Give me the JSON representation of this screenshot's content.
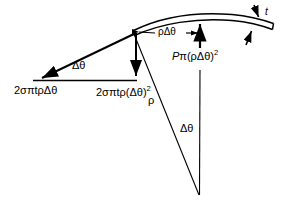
{
  "figure": {
    "stroke_color": "#000000",
    "background_color": "#ffffff",
    "labels": {
      "hoop_force": "2σπtρΔθ",
      "hoop_force_component": "2σπtρ(Δθ)",
      "hoop_force_component_exponent": "2",
      "triangle_angle": "Δθ",
      "arc_length": "ρΔθ",
      "pressure_force_P": "P",
      "pressure_force_rest": "π(ρΔθ)",
      "pressure_force_exponent": "2",
      "thickness": "t",
      "radius": "ρ",
      "sector_angle": "Δθ"
    }
  }
}
